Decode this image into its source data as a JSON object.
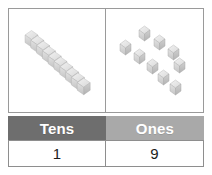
{
  "figure": {
    "name": "place-value-tens-ones-figure",
    "background": "#ffffff",
    "border_color": "#9a9a9a"
  },
  "panels": {
    "tens_panel": {
      "label": "tens-rod-panel",
      "manipulative": "unifix-cube-rod",
      "cube_count": 10,
      "orientation": "diagonal",
      "cube_color": "#d8d8d8"
    },
    "ones_panel": {
      "label": "ones-cubes-panel",
      "manipulative": "loose-unifix-cubes",
      "cube_count": 9,
      "cube_color": "#d8d8d8"
    }
  },
  "table": {
    "headers": [
      {
        "label": "Tens",
        "color": "#6e6e6e"
      },
      {
        "label": "Ones",
        "color": "#a9a9a9"
      }
    ],
    "values": [
      {
        "label": "1"
      },
      {
        "label": "9"
      }
    ]
  },
  "cube_geometry": {
    "rod_cubes": [
      {
        "x": 10.5,
        "y": 10.0
      },
      {
        "x": 16.0,
        "y": 15.2
      },
      {
        "x": 21.5,
        "y": 20.4
      },
      {
        "x": 27.0,
        "y": 25.6
      },
      {
        "x": 32.5,
        "y": 30.8
      },
      {
        "x": 38.0,
        "y": 36.0
      },
      {
        "x": 43.5,
        "y": 41.2
      },
      {
        "x": 49.0,
        "y": 46.4
      },
      {
        "x": 54.5,
        "y": 51.6
      },
      {
        "x": 60.0,
        "y": 56.8
      }
    ],
    "loose_cubes": [
      {
        "x": 33.0,
        "y": 16.0
      },
      {
        "x": 48.0,
        "y": 25.0
      },
      {
        "x": 14.0,
        "y": 30.0
      },
      {
        "x": 62.0,
        "y": 35.0
      },
      {
        "x": 28.0,
        "y": 39.0
      },
      {
        "x": 68.0,
        "y": 48.0
      },
      {
        "x": 41.0,
        "y": 49.0
      },
      {
        "x": 52.0,
        "y": 60.0
      },
      {
        "x": 64.0,
        "y": 70.0
      }
    ]
  }
}
